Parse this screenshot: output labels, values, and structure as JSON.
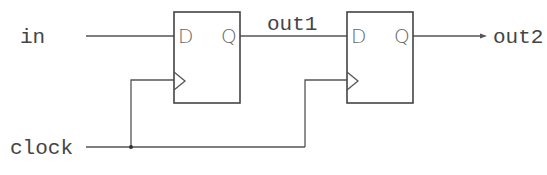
{
  "diagram": {
    "type": "circuit",
    "signals": {
      "input": "in",
      "clock": "clock",
      "intermediate": "out1",
      "output": "out2"
    },
    "flipflops": [
      {
        "id": "ff1",
        "d_label": "D",
        "q_label": "Q"
      },
      {
        "id": "ff2",
        "d_label": "D",
        "q_label": "Q"
      }
    ],
    "colors": {
      "wire": "#555555",
      "box": "#444444",
      "label": "#444444"
    }
  }
}
